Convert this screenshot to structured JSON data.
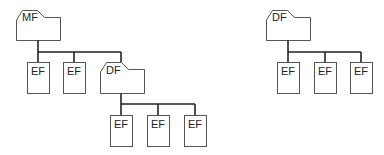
{
  "diagram": {
    "type": "file-structure-tree",
    "trees": [
      {
        "root": {
          "label": "MF",
          "kind": "folder"
        },
        "children": [
          {
            "label": "EF",
            "kind": "file"
          },
          {
            "label": "EF",
            "kind": "file"
          },
          {
            "label": "DF",
            "kind": "folder",
            "children": [
              {
                "label": "EF",
                "kind": "file"
              },
              {
                "label": "EF",
                "kind": "file"
              },
              {
                "label": "EF",
                "kind": "file"
              }
            ]
          }
        ]
      },
      {
        "root": {
          "label": "DF",
          "kind": "folder"
        },
        "children": [
          {
            "label": "EF",
            "kind": "file"
          },
          {
            "label": "EF",
            "kind": "file"
          },
          {
            "label": "EF",
            "kind": "file"
          }
        ]
      }
    ]
  },
  "labels": {
    "mf": "MF",
    "df_inner": "DF",
    "df_right": "DF",
    "ef": "EF"
  }
}
